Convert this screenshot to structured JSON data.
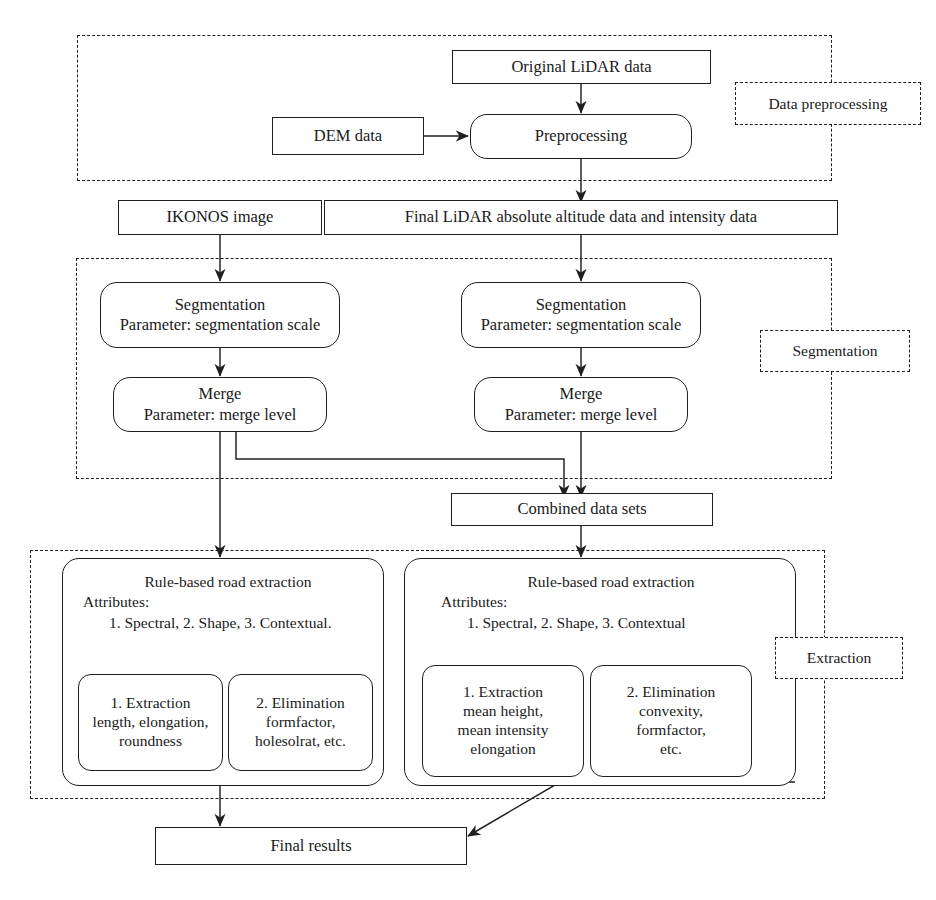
{
  "diagram": {
    "stroke_color": "#1f1f1f",
    "background_color": "#ffffff"
  },
  "stage_labels": {
    "preprocessing": "Data preprocessing",
    "segmentation": "Segmentation",
    "extraction": "Extraction"
  },
  "nodes": {
    "original_lidar": "Original LiDAR data",
    "dem_data": "DEM data",
    "preprocessing": "Preprocessing",
    "ikonos_image": "IKONOS image",
    "final_lidar": "Final LiDAR absolute altitude data and intensity data",
    "seg_left": {
      "line1": "Segmentation",
      "line2": "Parameter: segmentation scale"
    },
    "seg_right": {
      "line1": "Segmentation",
      "line2": "Parameter: segmentation scale"
    },
    "merge_left": {
      "line1": "Merge",
      "line2": "Parameter: merge level"
    },
    "merge_right": {
      "line1": "Merge",
      "line2": "Parameter: merge level"
    },
    "combined": "Combined data sets",
    "extract_left": {
      "title": "Rule-based road extraction",
      "attributes_label": "Attributes:",
      "attributes_list": "1. Spectral, 2. Shape, 3. Contextual.",
      "sub1": {
        "line1": "1. Extraction",
        "line2": "length, elongation,",
        "line3": "roundness"
      },
      "sub2": {
        "line1": "2. Elimination",
        "line2": "formfactor,",
        "line3": "holesolrat, etc."
      }
    },
    "extract_right": {
      "title": "Rule-based road extraction",
      "attributes_label": "Attributes:",
      "attributes_list": "1. Spectral, 2. Shape, 3. Contextual",
      "sub1": {
        "line1": "1. Extraction",
        "line2": "mean height,",
        "line3": "mean intensity",
        "line4": "elongation"
      },
      "sub2": {
        "line1": "2. Elimination",
        "line2": "convexity,",
        "line3": "formfactor,",
        "line4": "etc."
      }
    },
    "final_results": "Final results"
  },
  "flow_edges": [
    {
      "from": "original_lidar",
      "to": "preprocessing",
      "kind": "arrow-down"
    },
    {
      "from": "dem_data",
      "to": "preprocessing",
      "kind": "arrow-right"
    },
    {
      "from": "preprocessing",
      "to": "final_lidar",
      "kind": "arrow-down"
    },
    {
      "from": "ikonos_image",
      "to": "seg_left",
      "kind": "arrow-down"
    },
    {
      "from": "final_lidar",
      "to": "seg_right",
      "kind": "arrow-down"
    },
    {
      "from": "seg_left",
      "to": "merge_left",
      "kind": "arrow-down"
    },
    {
      "from": "seg_right",
      "to": "merge_right",
      "kind": "arrow-down"
    },
    {
      "from": "merge_left",
      "to": "extract_left",
      "kind": "line-down"
    },
    {
      "from": "merge_left",
      "to": "combined",
      "kind": "elbow-right-down"
    },
    {
      "from": "merge_right",
      "to": "combined",
      "kind": "arrow-down"
    },
    {
      "from": "combined",
      "to": "extract_right",
      "kind": "arrow-down"
    },
    {
      "from": "extract_left",
      "to": "final_results",
      "kind": "arrow-down"
    },
    {
      "from": "extract_right",
      "to": "final_results",
      "kind": "elbow-diagonal"
    }
  ]
}
